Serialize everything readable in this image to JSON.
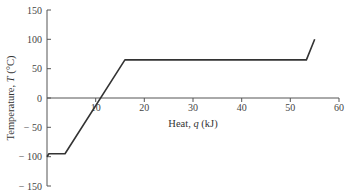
{
  "chart_data": {
    "type": "line",
    "title": "",
    "xlabel": "Heat, q (kJ)",
    "ylabel": "Temperature, T (°C)",
    "xlim": [
      0,
      60
    ],
    "ylim": [
      -150,
      150
    ],
    "xticks": [
      10,
      20,
      30,
      40,
      50,
      60
    ],
    "yticks": [
      150,
      100,
      50,
      0,
      -50,
      -100,
      -150
    ],
    "grid": false,
    "legend": null,
    "series": [
      {
        "name": "Heating curve",
        "x": [
          0,
          0.4,
          3.7,
          16,
          53.3,
          55
        ],
        "y": [
          -100,
          -95,
          -95,
          65,
          65,
          100
        ]
      }
    ],
    "colors": {
      "line": "#333333",
      "axis": "#555555"
    }
  },
  "labels": {
    "x_axis": "Heat, ",
    "x_var": "q",
    "x_unit": " (kJ)",
    "y_axis": "Temperature, ",
    "y_var": "T",
    "y_unit": " (°C)"
  },
  "tick_labels": {
    "x": [
      "10",
      "20",
      "30",
      "40",
      "50",
      "60"
    ],
    "y": [
      "150",
      "100",
      "50",
      "0",
      "− 50",
      "− 100",
      "− 150"
    ]
  }
}
